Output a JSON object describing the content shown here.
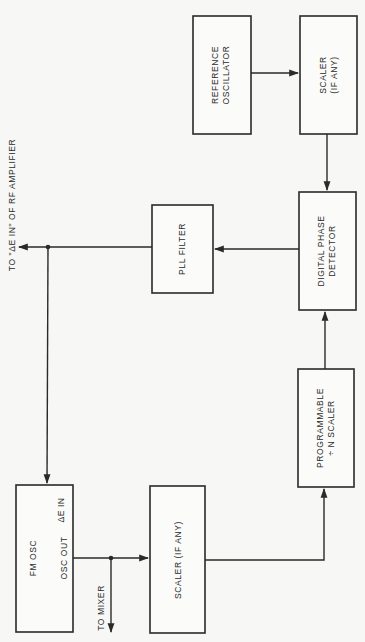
{
  "diagram": {
    "orientation": "rotated-90-ccw",
    "blocks": {
      "reference_oscillator": {
        "line1": "REFERENCE",
        "line2": "OSCILLATOR"
      },
      "scaler_top": {
        "line1": "SCALER",
        "line2": "(IF ANY)"
      },
      "digital_phase_detector": {
        "line1": "DIGITAL PHASE",
        "line2": "DETECTOR"
      },
      "pll_filter": {
        "label": "PLL FILTER"
      },
      "programmable_scaler": {
        "line1": "PROGRAMMABLE",
        "line2": "÷ N SCALER"
      },
      "fm_osc": {
        "label": "FM OSC",
        "port_in": "ΔE IN",
        "port_out": "OSC OUT"
      },
      "scaler_bottom": {
        "label": "SCALER (IF ANY)"
      }
    },
    "external_labels": {
      "rf_amplifier": "TO \"ΔE IN\" OF RF AMPLIFIER",
      "mixer": "TO MIXER"
    },
    "connections": [
      {
        "from": "reference_oscillator",
        "to": "scaler_top"
      },
      {
        "from": "scaler_top",
        "to": "digital_phase_detector"
      },
      {
        "from": "digital_phase_detector",
        "to": "pll_filter"
      },
      {
        "from": "pll_filter",
        "to": "rf_amplifier"
      },
      {
        "from": "pll_filter",
        "to": "fm_osc"
      },
      {
        "from": "fm_osc",
        "to": "mixer"
      },
      {
        "from": "fm_osc",
        "to": "scaler_bottom"
      },
      {
        "from": "scaler_bottom",
        "to": "programmable_scaler"
      },
      {
        "from": "programmable_scaler",
        "to": "digital_phase_detector"
      }
    ]
  }
}
